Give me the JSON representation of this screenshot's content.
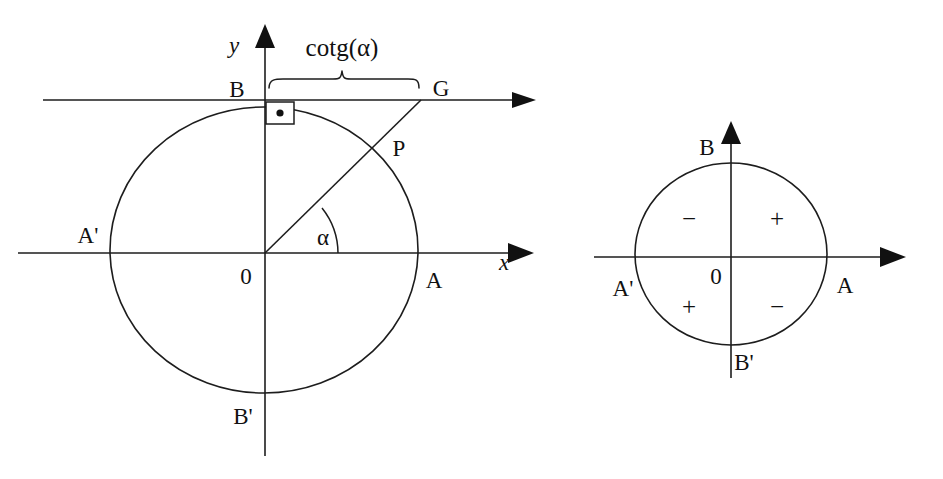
{
  "figure": {
    "ink_color": "#1d1d1d",
    "background_color": "#ffffff"
  },
  "left_diagram": {
    "name": "cotangent-construction",
    "axis_labels": {
      "x_axis": "x",
      "y_axis": "y"
    },
    "points": {
      "origin": "0",
      "right": "A",
      "left": "A'",
      "top": "B",
      "bottom": "B'",
      "on_circle": "P",
      "on_tangent": "G"
    },
    "angle_label": "α",
    "segment_label": "cotg(α)",
    "geometry": {
      "center": [
        264,
        250
      ],
      "radius": 154,
      "radius_y": 143,
      "angle_degrees": 38,
      "tangent_line_y": 100
    }
  },
  "right_diagram": {
    "name": "cotangent-sign-chart",
    "points": {
      "origin": "0",
      "right": "A",
      "left": "A'",
      "top": "B",
      "bottom": "B'"
    },
    "quadrant_signs": {
      "quadrant_I": "+",
      "quadrant_II": "−",
      "quadrant_III": "+",
      "quadrant_IV": "−"
    },
    "geometry": {
      "center": [
        731,
        254
      ],
      "radius_x": 96,
      "radius_y": 91
    }
  }
}
